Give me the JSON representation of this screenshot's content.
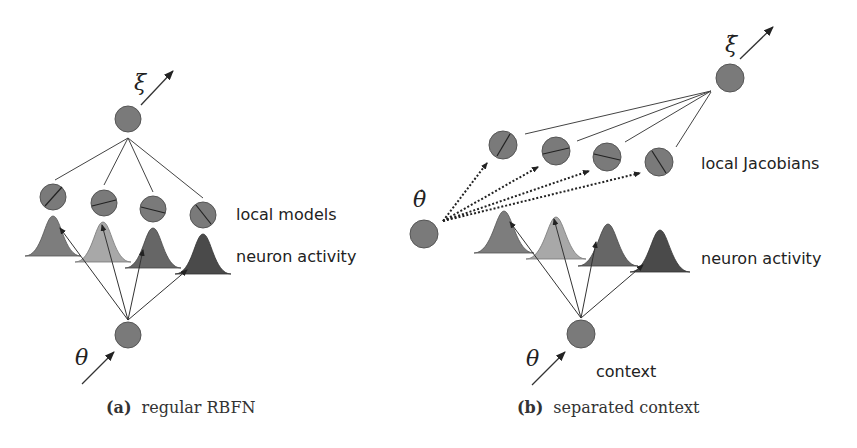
{
  "panel_a": {
    "caption_tag": "(a)",
    "caption_text": "regular RBFN",
    "output_symbol": "ξ",
    "input_symbol": "θ",
    "row_labels": {
      "local_models": "local models",
      "neuron_activity": "neuron activity"
    }
  },
  "panel_b": {
    "caption_tag": "(b)",
    "caption_text": "separated context",
    "output_symbol": "ξ̇",
    "velocity_input_symbol": "θ̇",
    "context_input_symbol": "θ",
    "row_labels": {
      "local_jacobians": "local Jacobians",
      "neuron_activity": "neuron activity",
      "context": "context"
    }
  },
  "colors": {
    "node_fill": "#7a7a7a",
    "node_stroke": "#555555",
    "gaussian_shades": [
      "#7d7d7d",
      "#a8a8a8",
      "#666666",
      "#4a4a4a"
    ],
    "line": "#333333"
  }
}
